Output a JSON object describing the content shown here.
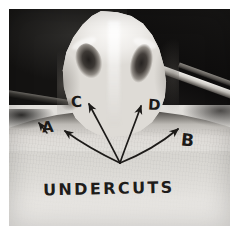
{
  "image": {
    "kind": "photograph",
    "medium": "black-and-white photographic print",
    "subject": "dental plaster cast specimen with two cavity depressions",
    "caption": "UNDERCUTS"
  },
  "annotations": {
    "caption_text": "UNDERCUTS",
    "arrow_labels": [
      {
        "id": "A",
        "label": "A",
        "points_to": "left lateral undercut"
      },
      {
        "id": "B",
        "label": "B",
        "points_to": "right lateral undercut"
      },
      {
        "id": "C",
        "label": "C",
        "points_to": "left central cavity"
      },
      {
        "id": "D",
        "label": "D",
        "points_to": "right central cavity"
      }
    ],
    "arrow_origin": {
      "x": 111,
      "y": 154
    },
    "ink_color": "#1c1a18"
  },
  "palette": {
    "background_dark": "#141312",
    "cast_white": "#f4f2ef",
    "base_gray": "#dcdad6",
    "cavity_dark": "#221f1d",
    "paper_white": "#ffffff",
    "ink": "#1c1a18"
  }
}
